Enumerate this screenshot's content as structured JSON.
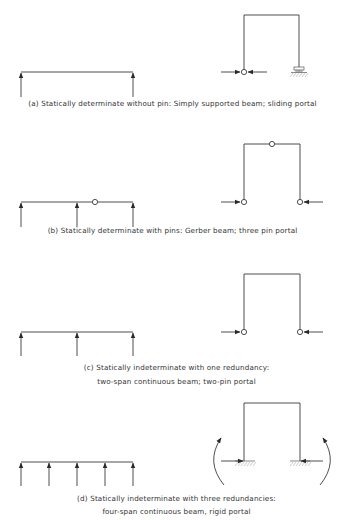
{
  "figure": {
    "panels": [
      {
        "id": "a",
        "caption_lines": [
          "(a) Statically determinate without pin: Simply supported beam; sliding portal"
        ],
        "beam": {
          "type": "simply supported beam",
          "supports": 2,
          "internal_pins": 0
        },
        "portal": {
          "type": "sliding portal",
          "left_support": "pin",
          "right_support": "roller"
        }
      },
      {
        "id": "b",
        "caption_lines": [
          "(b) Statically determinate with pins: Gerber beam; three pin portal"
        ],
        "beam": {
          "type": "Gerber beam",
          "supports": 3,
          "internal_pins": 1
        },
        "portal": {
          "type": "three pin portal",
          "left_support": "pin",
          "right_support": "pin",
          "top_pin": true
        }
      },
      {
        "id": "c",
        "caption_lines": [
          "(c) Statically indeterminate with one redundancy:",
          "two-span continuous beam; two-pin portal"
        ],
        "beam": {
          "type": "two-span continuous beam",
          "supports": 3,
          "internal_pins": 0
        },
        "portal": {
          "type": "two-pin portal",
          "left_support": "pin",
          "right_support": "pin"
        }
      },
      {
        "id": "d",
        "caption_lines": [
          "(d) Statically indeterminate with three redundancies:",
          "four-span continuous beam, rigid portal"
        ],
        "beam": {
          "type": "four-span continuous beam",
          "supports": 5,
          "internal_pins": 0
        },
        "portal": {
          "type": "rigid portal",
          "left_support": "fixed",
          "right_support": "fixed",
          "moment_reactions": true
        }
      }
    ]
  },
  "colors": {
    "line": "#3a3a3a",
    "hatch": "#9a9a9a",
    "text": "#333333",
    "background": "#ffffff"
  }
}
